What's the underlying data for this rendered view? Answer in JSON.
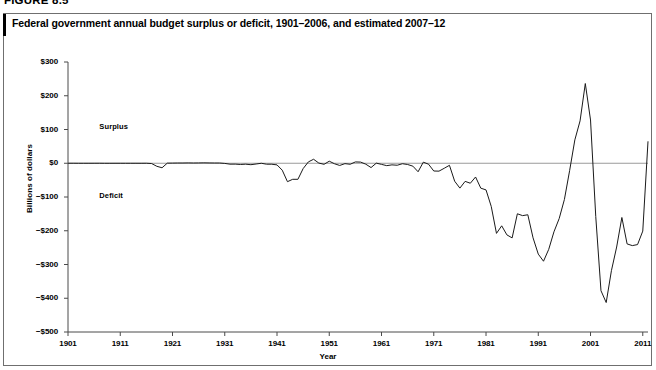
{
  "figure": {
    "label": "FIGURE 8.5",
    "title": "Federal government annual budget surplus or deficit, 1901–2006, and estimated 2007–12"
  },
  "chart_data": {
    "type": "line",
    "title": "Federal government annual budget surplus or deficit, 1901–2006, and estimated 2007–12",
    "xlabel": "Year",
    "ylabel": "Billions of dollars",
    "xlim": [
      1901,
      2012
    ],
    "ylim": [
      -500,
      300
    ],
    "ytick_labels": [
      "$300",
      "$200",
      "$100",
      "$0",
      "−$100",
      "−$200",
      "−$300",
      "−$400",
      "−$500"
    ],
    "yticks": [
      300,
      200,
      100,
      0,
      -100,
      -200,
      -300,
      -400,
      -500
    ],
    "xtick_labels": [
      "1901",
      "1911",
      "1921",
      "1931",
      "1941",
      "1951",
      "1961",
      "1971",
      "1981",
      "1991",
      "2001",
      "2011"
    ],
    "xticks": [
      1901,
      1911,
      1921,
      1931,
      1941,
      1951,
      1961,
      1971,
      1981,
      1991,
      2001,
      2011
    ],
    "grid": false,
    "legend": false,
    "annotations": [
      {
        "text": "Surplus",
        "x": 1907,
        "y": 108
      },
      {
        "text": "Deficit",
        "x": 1907,
        "y": -96
      }
    ],
    "zero_line": 0,
    "line_color": "#1a1a1a",
    "series": [
      {
        "name": "Surplus or deficit",
        "x": [
          1901,
          1902,
          1903,
          1904,
          1905,
          1906,
          1907,
          1908,
          1909,
          1910,
          1911,
          1912,
          1913,
          1914,
          1915,
          1916,
          1917,
          1918,
          1919,
          1920,
          1921,
          1922,
          1923,
          1924,
          1925,
          1926,
          1927,
          1928,
          1929,
          1930,
          1931,
          1932,
          1933,
          1934,
          1935,
          1936,
          1937,
          1938,
          1939,
          1940,
          1941,
          1942,
          1943,
          1944,
          1945,
          1946,
          1947,
          1948,
          1949,
          1950,
          1951,
          1952,
          1953,
          1954,
          1955,
          1956,
          1957,
          1958,
          1959,
          1960,
          1961,
          1962,
          1963,
          1964,
          1965,
          1966,
          1967,
          1968,
          1969,
          1970,
          1971,
          1972,
          1973,
          1974,
          1975,
          1976,
          1977,
          1978,
          1979,
          1980,
          1981,
          1982,
          1983,
          1984,
          1985,
          1986,
          1987,
          1988,
          1989,
          1990,
          1991,
          1992,
          1993,
          1994,
          1995,
          1996,
          1997,
          1998,
          1999,
          2000,
          2001,
          2002,
          2003,
          2004,
          2005,
          2006,
          2007,
          2008,
          2009,
          2010,
          2011,
          2012
        ],
        "values": [
          0.1,
          0.1,
          0.0,
          -0.04,
          -0.02,
          0.03,
          0.09,
          -0.06,
          -0.09,
          -0.02,
          0.01,
          0.0,
          -0.0,
          -0.0,
          -0.06,
          0.05,
          -0.85,
          -9.0,
          -13.4,
          0.3,
          0.5,
          0.7,
          0.7,
          1.0,
          0.7,
          0.9,
          1.2,
          0.9,
          0.7,
          0.7,
          -0.5,
          -2.7,
          -2.6,
          -3.6,
          -2.8,
          -4.3,
          -2.2,
          -0.1,
          -2.8,
          -2.9,
          -4.9,
          -20.5,
          -54.6,
          -47.6,
          -47.6,
          -15.9,
          4.0,
          11.8,
          0.6,
          -3.1,
          6.1,
          -1.5,
          -6.5,
          -1.2,
          -3.0,
          3.9,
          3.4,
          -2.8,
          -12.8,
          0.3,
          -3.3,
          -7.1,
          -4.8,
          -5.9,
          -1.4,
          -3.7,
          -8.6,
          -25.2,
          3.2,
          -2.8,
          -23.0,
          -23.4,
          -14.9,
          -6.1,
          -53.2,
          -73.7,
          -53.7,
          -59.2,
          -40.7,
          -73.8,
          -79.0,
          -128.0,
          -207.8,
          -185.4,
          -212.3,
          -221.2,
          -149.7,
          -155.2,
          -152.6,
          -221.0,
          -269.2,
          -290.3,
          -255.1,
          -203.2,
          -164.0,
          -107.4,
          -21.9,
          69.3,
          125.6,
          236.2,
          128.2,
          -157.8,
          -377.6,
          -412.7,
          -318.3,
          -248.2,
          -160.7,
          -239.0,
          -244.0,
          -241.0,
          -201.0,
          65.0
        ]
      }
    ]
  }
}
